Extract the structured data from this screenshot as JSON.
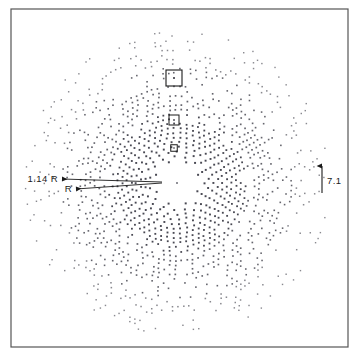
{
  "figure": {
    "type": "scatter",
    "background_color": "#ffffff",
    "frame": {
      "name": "figure-border",
      "x": 11,
      "y": 9,
      "width": 337,
      "height": 338,
      "stroke_color": "#555555",
      "stroke_width": 1.2
    },
    "width": 359,
    "height": 357
  },
  "chart_data": {
    "type": "scatter",
    "title": "",
    "subtitle": "",
    "xlabel": "",
    "ylabel": "",
    "grid": false,
    "legend": null,
    "axis_ticks": [],
    "tick_labels": [],
    "center": {
      "x": 177,
      "y": 183
    },
    "pattern": {
      "name": "radial-dot-pattern",
      "outer_radius": 152,
      "inner_blank_radius": 18,
      "ring_count": 30,
      "ring_radial_step": 4.6,
      "base_spokes": 8,
      "spoke_growth": 1.0,
      "dot_size_inner": 2.0,
      "dot_size_outer": 1.4,
      "dot_color": "#3a3a44",
      "jitter": 0.55,
      "angular_offset_deg": 0
    },
    "center_dot": {
      "name": "central-reflection",
      "x": 177,
      "y": 183,
      "size": 1.6,
      "color": "#555560"
    },
    "boxes": [
      {
        "name": "highlight-box-outer",
        "cx": 174,
        "cy": 78,
        "size": 16,
        "stroke_width": 1.1,
        "dot_size": 1.8
      },
      {
        "name": "highlight-box-middle",
        "cx": 174,
        "cy": 120,
        "size": 10,
        "stroke_width": 1.0,
        "dot_size": 1.6
      },
      {
        "name": "highlight-box-inner",
        "cx": 174,
        "cy": 148,
        "size": 6.5,
        "stroke_width": 1.0,
        "dot_size": 1.4
      }
    ],
    "annotations": [
      {
        "name": "annotation-1-14-r",
        "label": "1.14 R",
        "label_x": 29,
        "label_y": 182,
        "arrow_tip_x": 62,
        "arrow_tip_y": 179,
        "arrow_tail_x": 162,
        "arrow_tail_y": 182
      },
      {
        "name": "annotation-r",
        "label": "R",
        "label_x": 64,
        "label_y": 192,
        "arrow_tip_x": 76,
        "arrow_tip_y": 189,
        "arrow_tail_x": 162,
        "arrow_tail_y": 183
      }
    ],
    "scale_bar": {
      "name": "scale-bar",
      "label": "7.1",
      "x": 322,
      "y_bottom": 193,
      "y_top": 166,
      "label_x": 327,
      "label_y": 184,
      "stroke_width": 1.1,
      "color": "#1a1a1a"
    }
  }
}
